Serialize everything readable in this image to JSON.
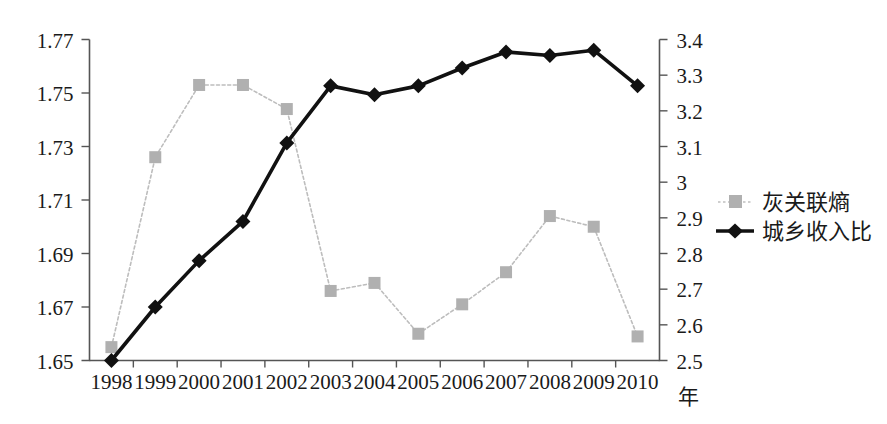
{
  "chart_data": {
    "type": "line",
    "title": "",
    "subtitle": "",
    "xlabel": "年",
    "ylabel": "",
    "y2label": "",
    "grid": false,
    "legend_position": "right-middle",
    "categories": [
      "1998",
      "1999",
      "2000",
      "2001",
      "2002",
      "2003",
      "2004",
      "2005",
      "2006",
      "2007",
      "2008",
      "2009",
      "2010"
    ],
    "x_tick_labels": [
      "1998",
      "1999",
      "2000",
      "2001",
      "2002",
      "2003",
      "2004",
      "2005",
      "2006",
      "2007",
      "2008",
      "2009",
      "2010"
    ],
    "left_axis": {
      "ticks": [
        "1.65",
        "1.67",
        "1.69",
        "1.71",
        "1.73",
        "1.75",
        "1.77"
      ],
      "min": 1.65,
      "max": 1.77,
      "step": 0.02
    },
    "right_axis": {
      "ticks": [
        "2.5",
        "2.6",
        "2.7",
        "2.8",
        "2.9",
        "3",
        "3.1",
        "3.2",
        "3.3",
        "3.4"
      ],
      "min": 2.5,
      "max": 3.4,
      "step": 0.1
    },
    "series": [
      {
        "name": "灰关联熵",
        "axis": "left",
        "marker": "square",
        "color": "#bdbdbd",
        "marker_color": "#b0b0b0",
        "values": [
          1.655,
          1.726,
          1.753,
          1.753,
          1.744,
          1.676,
          1.679,
          1.66,
          1.671,
          1.683,
          1.704,
          1.7,
          1.659
        ]
      },
      {
        "name": "城乡收入比",
        "axis": "right",
        "marker": "diamond",
        "color": "#111111",
        "marker_color": "#111111",
        "values": [
          2.5,
          2.65,
          2.78,
          2.89,
          3.11,
          3.27,
          3.245,
          3.27,
          3.32,
          3.365,
          3.355,
          3.37,
          3.27
        ]
      }
    ]
  },
  "legend": {
    "items": [
      {
        "label": "灰关联熵",
        "marker": "square-marker",
        "color": "#b0b0b0"
      },
      {
        "label": "城乡收入比",
        "marker": "diamond-marker",
        "color": "#111111"
      }
    ]
  },
  "axes": {
    "x_axis_title": "年"
  }
}
